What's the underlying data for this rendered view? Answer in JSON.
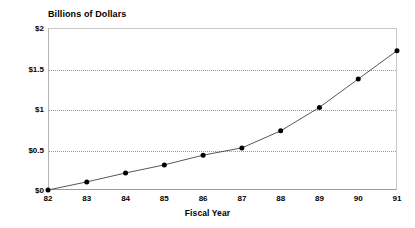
{
  "chart_data": {
    "type": "line",
    "title": "Billions of Dollars",
    "xlabel": "Fiscal Year",
    "ylabel": "",
    "categories": [
      "82",
      "83",
      "84",
      "85",
      "86",
      "87",
      "88",
      "89",
      "90",
      "91"
    ],
    "x": [
      82,
      83,
      84,
      85,
      86,
      87,
      88,
      89,
      90,
      91
    ],
    "values": [
      0.0,
      0.1,
      0.21,
      0.31,
      0.43,
      0.52,
      0.73,
      1.02,
      1.37,
      1.72
    ],
    "series": [
      {
        "name": "Billions of Dollars",
        "values": [
          0.0,
          0.1,
          0.21,
          0.31,
          0.43,
          0.52,
          0.73,
          1.02,
          1.37,
          1.72
        ]
      }
    ],
    "ylim": [
      0,
      2
    ],
    "xlim": [
      82,
      91
    ],
    "yticks": [
      0,
      0.5,
      1,
      1.5,
      2
    ],
    "ytick_labels": [
      "$0",
      "$0.5",
      "$1",
      "$1.5",
      "$2"
    ],
    "xtick_labels": [
      "82",
      "83",
      "84",
      "85",
      "86",
      "87",
      "88",
      "89",
      "90",
      "91"
    ],
    "grid": "horizontal-dotted",
    "legend": "none",
    "marker": "filled-circle",
    "line_color": "#444444",
    "marker_color": "#000000",
    "grid_color": "#9a9a9a",
    "axis_color": "#9a9a9a",
    "background_color": "#ffffff"
  }
}
